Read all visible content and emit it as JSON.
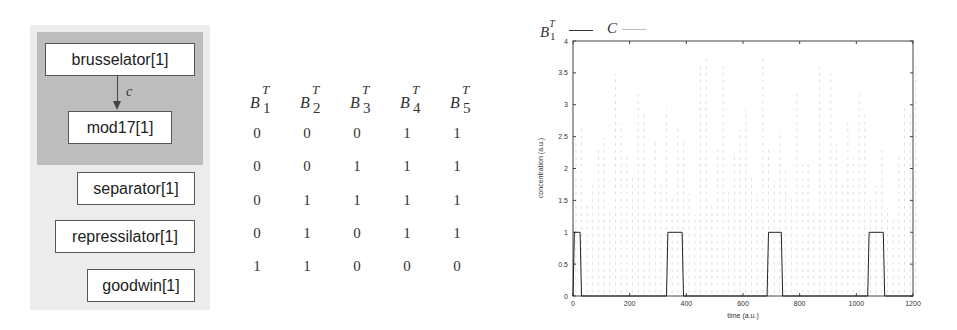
{
  "diagram": {
    "group_nodes": [
      {
        "label": "brusselator[1]"
      },
      {
        "label": "mod17[1]"
      }
    ],
    "edge_label": "c",
    "other_nodes": [
      {
        "label": "separator[1]"
      },
      {
        "label": "repressilator[1]"
      },
      {
        "label": "goodwin[1]"
      }
    ]
  },
  "table": {
    "headers": [
      {
        "base": "B",
        "sup": "T",
        "sub": "1"
      },
      {
        "base": "B",
        "sup": "T",
        "sub": "2"
      },
      {
        "base": "B",
        "sup": "T",
        "sub": "3"
      },
      {
        "base": "B",
        "sup": "T",
        "sub": "4"
      },
      {
        "base": "B",
        "sup": "T",
        "sub": "5"
      }
    ],
    "rows": [
      [
        "0",
        "0",
        "0",
        "1",
        "1"
      ],
      [
        "0",
        "0",
        "1",
        "1",
        "1"
      ],
      [
        "0",
        "1",
        "1",
        "1",
        "1"
      ],
      [
        "0",
        "1",
        "0",
        "1",
        "1"
      ],
      [
        "1",
        "1",
        "0",
        "0",
        "0"
      ]
    ]
  },
  "legend": {
    "b1_base": "B",
    "b1_sup": "T",
    "b1_sub": "1",
    "c_label": "C"
  },
  "chart_data": {
    "type": "line",
    "title": "",
    "xlabel": "time (a.u.)",
    "ylabel": "concentration (a.u.)",
    "xlim": [
      0,
      1200
    ],
    "ylim": [
      0,
      4
    ],
    "xticks": [
      0,
      200,
      400,
      600,
      800,
      1000,
      1200
    ],
    "yticks": [
      0,
      0.5,
      1,
      1.5,
      2,
      2.5,
      3,
      3.5,
      4
    ],
    "grid": false,
    "legend_position": "top-left, outside",
    "series": [
      {
        "name": "B1^T",
        "color": "#222222",
        "x": [
          0,
          5,
          25,
          30,
          330,
          335,
          385,
          390,
          685,
          690,
          735,
          740,
          1040,
          1045,
          1095,
          1100,
          1200
        ],
        "y": [
          0,
          1,
          1,
          0,
          0,
          1,
          1,
          0,
          0,
          1,
          1,
          0,
          0,
          1,
          1,
          0,
          0
        ]
      },
      {
        "name": "C",
        "color": "#d8d8d8",
        "description": "fast faint oscillation between ~0 and ~3.8 across whole time range",
        "period_approx": 20,
        "amplitude_range": [
          0,
          3.8
        ]
      }
    ]
  }
}
